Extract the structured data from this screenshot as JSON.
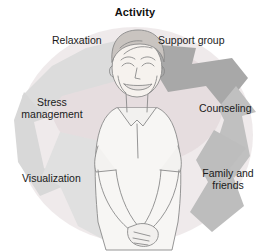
{
  "diagram": {
    "title": "Activity",
    "type": "cycle",
    "center_figure": "smiling-woman-illustration",
    "labels": [
      {
        "id": "relaxation",
        "text": "Relaxation",
        "position": "top-left"
      },
      {
        "id": "support-group",
        "text": "Support group",
        "position": "top-right"
      },
      {
        "id": "stress-management",
        "text": "Stress\nmanagement",
        "position": "left"
      },
      {
        "id": "counseling",
        "text": "Counseling",
        "position": "right"
      },
      {
        "id": "visualization",
        "text": "Visualization",
        "position": "bottom-left"
      },
      {
        "id": "family-and-friends",
        "text": "Family and\nfriends",
        "position": "bottom-right"
      }
    ],
    "arrows": [
      {
        "id": "arrow-top-left",
        "tone": "light"
      },
      {
        "id": "arrow-top-right",
        "tone": "dark"
      },
      {
        "id": "arrow-right",
        "tone": "medium"
      },
      {
        "id": "arrow-bottom-right",
        "tone": "medium"
      },
      {
        "id": "arrow-bottom-left",
        "tone": "light"
      },
      {
        "id": "arrow-left",
        "tone": "light"
      }
    ],
    "colors": {
      "background": "#ffffff",
      "title_text": "#111111",
      "label_text": "#1a1a1a",
      "arrow_light": "#dcdcdc",
      "arrow_medium": "#c4c4c4",
      "arrow_dark": "#a8a8a8",
      "ring_wash": "#e8e2e4",
      "figure_line": "#7a7a7a",
      "figure_fill": "#f5f4f2"
    }
  }
}
